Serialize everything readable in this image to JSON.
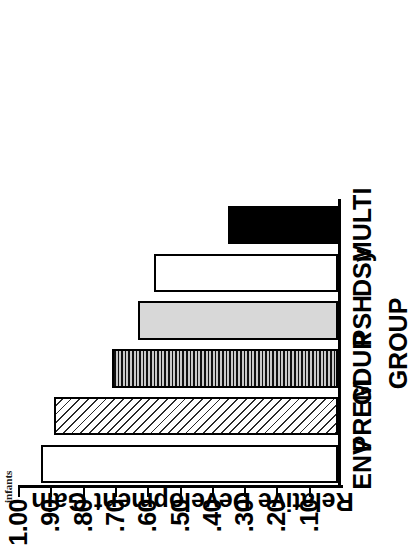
{
  "page_fragment": "infants",
  "chart_data": {
    "type": "bar",
    "orientation": "horizontal-rotated",
    "title": "",
    "xlabel": "GROUP",
    "ylabel": "Relative Development Gain",
    "categories": [
      "ENV",
      "PREM",
      "GDUR",
      "PSH",
      "DSy",
      "MULTI"
    ],
    "values": [
      0.92,
      0.88,
      0.7,
      0.62,
      0.57,
      0.34
    ],
    "series": [
      {
        "name": "Relative Development Gain",
        "values": [
          0.92,
          0.88,
          0.7,
          0.62,
          0.57,
          0.34
        ]
      }
    ],
    "ylim": [
      0,
      1.0
    ],
    "ytick_labels": [
      "1.00",
      ".90",
      ".80",
      ".70",
      ".60",
      ".50",
      ".40",
      ".30",
      ".20",
      ".10"
    ],
    "ytick_values": [
      1.0,
      0.9,
      0.8,
      0.7,
      0.6,
      0.5,
      0.4,
      0.3,
      0.2,
      0.1
    ],
    "grid": false,
    "legend": "none",
    "bar_styles": [
      {
        "category": "ENV",
        "fill": "open",
        "color": "#ffffff"
      },
      {
        "category": "PREM",
        "fill": "diagonal-hatch",
        "color": "#ffffff"
      },
      {
        "category": "GDUR",
        "fill": "horizontal-lines",
        "color": "#9a9a9a"
      },
      {
        "category": "PSH",
        "fill": "stipple",
        "color": "#d8d8d8"
      },
      {
        "category": "DSy",
        "fill": "open",
        "color": "#ffffff"
      },
      {
        "category": "MULTI",
        "fill": "solid",
        "color": "#000000"
      }
    ]
  }
}
